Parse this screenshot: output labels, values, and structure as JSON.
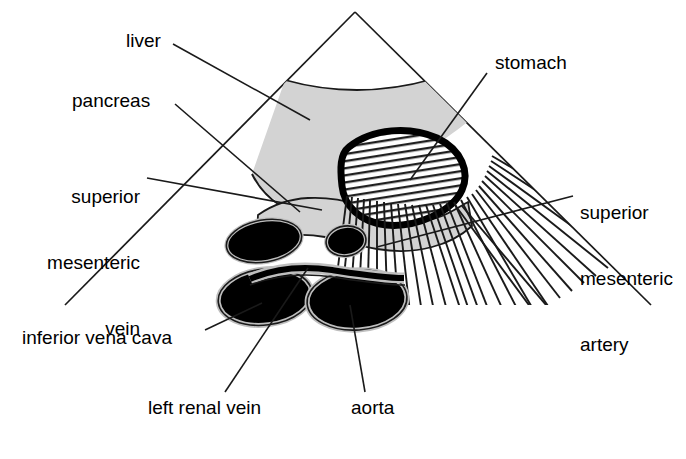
{
  "figure": {
    "type": "anatomical-ultrasound-diagram",
    "background_color": "#ffffff",
    "line_color": "#1a1a1a",
    "tissue_gray": "#d3d3d3",
    "vessel_black": "#000000",
    "sector": {
      "apex_x": 355,
      "apex_y": 12,
      "left_end_x": 65,
      "left_end_y": 305,
      "right_end_x": 651,
      "right_end_y": 305
    }
  },
  "labels": {
    "liver": "liver",
    "pancreas": "pancreas",
    "superior_mesenteric_vein_line1": "superior",
    "superior_mesenteric_vein_line2": "mesenteric",
    "superior_mesenteric_vein_line3": "vein",
    "inferior_vena_cava": "inferior vena cava",
    "left_renal_vein": "left renal vein",
    "aorta": "aorta",
    "stomach": "stomach",
    "superior_mesenteric_artery_line1": "superior",
    "superior_mesenteric_artery_line2": "mesenteric",
    "superior_mesenteric_artery_line3": "artery"
  },
  "structures": [
    {
      "name": "liver",
      "fill": "#d3d3d3",
      "kind": "organ"
    },
    {
      "name": "pancreas",
      "fill": "#d3d3d3",
      "kind": "organ"
    },
    {
      "name": "stomach",
      "fill": "#ffffff",
      "kind": "organ",
      "outline": "thick-black",
      "pattern": "hatched"
    },
    {
      "name": "inferior-vena-cava",
      "fill": "#000000",
      "kind": "vessel"
    },
    {
      "name": "superior-mesenteric-vein",
      "fill": "#000000",
      "kind": "vessel"
    },
    {
      "name": "superior-mesenteric-artery",
      "fill": "#000000",
      "kind": "vessel"
    },
    {
      "name": "left-renal-vein",
      "fill": "#000000",
      "kind": "vessel"
    },
    {
      "name": "aorta",
      "fill": "#000000",
      "kind": "vessel"
    },
    {
      "name": "acoustic-shadow",
      "fill": "none",
      "kind": "artifact"
    }
  ]
}
